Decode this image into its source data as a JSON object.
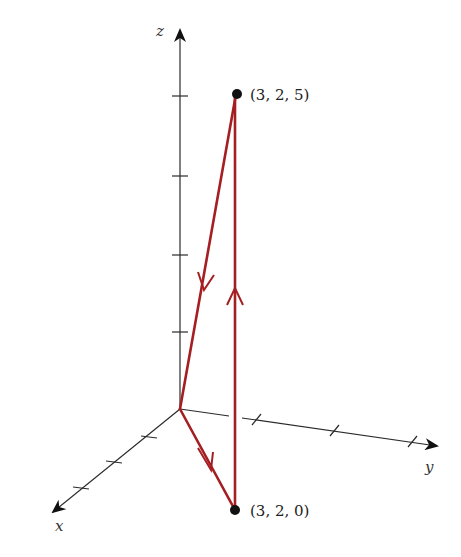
{
  "diagram": {
    "type": "3d-coordinate-path",
    "axes": {
      "x_label": "x",
      "y_label": "y",
      "z_label": "z"
    },
    "points": [
      {
        "label": "(3, 2, 5)",
        "coords": [
          3,
          2,
          5
        ]
      },
      {
        "label": "(3, 2, 0)",
        "coords": [
          3,
          2,
          0
        ]
      }
    ],
    "path": {
      "color": "#a41e22",
      "segments": [
        {
          "from": "(3, 2, 5)",
          "to": "origin",
          "direction": "down"
        },
        {
          "from": "origin",
          "to": "(3, 2, 0)",
          "direction": "toward point"
        },
        {
          "from": "(3, 2, 0)",
          "to": "(3, 2, 5)",
          "direction": "up"
        }
      ]
    }
  }
}
